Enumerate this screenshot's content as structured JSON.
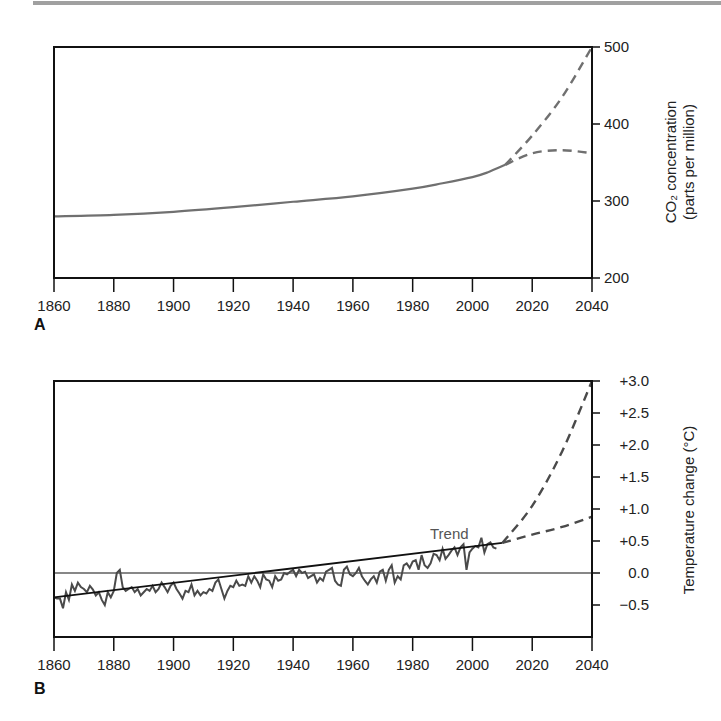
{
  "chart_data": [
    {
      "panel": "A",
      "type": "line",
      "title": "",
      "xlabel": "",
      "ylabel": "CO2 concentration (parts per million)",
      "ylabel_line1": "CO₂ concentration",
      "ylabel_line2": "(parts per million)",
      "xlim": [
        1860,
        2040
      ],
      "ylim": [
        200,
        500
      ],
      "x_ticks": [
        1860,
        1880,
        1900,
        1920,
        1940,
        1960,
        1980,
        2000,
        2020,
        2040
      ],
      "y_ticks": [
        200,
        300,
        400,
        500
      ],
      "y_axis_position": "right",
      "grid": false,
      "series": [
        {
          "name": "Observed CO2",
          "style": "solid",
          "color": "#707070",
          "x": [
            1860,
            1880,
            1900,
            1920,
            1940,
            1960,
            1980,
            1990,
            2000,
            2005,
            2011
          ],
          "values": [
            280,
            282,
            286,
            292,
            299,
            306,
            316,
            323,
            331,
            337,
            347
          ]
        },
        {
          "name": "Projection (high)",
          "style": "dashed",
          "color": "#707070",
          "x": [
            2011,
            2020,
            2030,
            2040
          ],
          "values": [
            347,
            385,
            435,
            500
          ]
        },
        {
          "name": "Projection (stabilized)",
          "style": "dashed",
          "color": "#707070",
          "x": [
            2011,
            2020,
            2030,
            2040
          ],
          "values": [
            347,
            362,
            366,
            362
          ]
        }
      ]
    },
    {
      "panel": "B",
      "type": "line",
      "title": "",
      "xlabel": "",
      "ylabel": "Temperature change (°C)",
      "xlim": [
        1860,
        2040
      ],
      "ylim": [
        -1.0,
        3.0
      ],
      "x_ticks": [
        1860,
        1880,
        1900,
        1920,
        1940,
        1960,
        1980,
        2000,
        2020,
        2040
      ],
      "y_ticks": [
        -0.5,
        0.0,
        0.5,
        1.0,
        1.5,
        2.0,
        2.5,
        3.0
      ],
      "y_tick_labels": [
        "−0.5",
        "0.0",
        "+0.5",
        "+1.0",
        "+1.5",
        "+2.0",
        "+2.5",
        "+3.0"
      ],
      "y_axis_position": "right",
      "reference_line": 0.0,
      "grid": false,
      "annotations": [
        {
          "text": "Trend",
          "x": 1990,
          "y": 0.62
        }
      ],
      "series": [
        {
          "name": "Annual temperature anomaly",
          "style": "solid",
          "color": "#4a4a4a",
          "x": [
            1860,
            1861,
            1862,
            1863,
            1864,
            1865,
            1866,
            1867,
            1868,
            1869,
            1870,
            1871,
            1872,
            1873,
            1874,
            1875,
            1876,
            1877,
            1878,
            1879,
            1880,
            1881,
            1882,
            1883,
            1884,
            1885,
            1886,
            1887,
            1888,
            1889,
            1890,
            1891,
            1892,
            1893,
            1894,
            1895,
            1896,
            1897,
            1898,
            1899,
            1900,
            1901,
            1902,
            1903,
            1904,
            1905,
            1906,
            1907,
            1908,
            1909,
            1910,
            1911,
            1912,
            1913,
            1914,
            1915,
            1916,
            1917,
            1918,
            1919,
            1920,
            1921,
            1922,
            1923,
            1924,
            1925,
            1926,
            1927,
            1928,
            1929,
            1930,
            1931,
            1932,
            1933,
            1934,
            1935,
            1936,
            1937,
            1938,
            1939,
            1940,
            1941,
            1942,
            1943,
            1944,
            1945,
            1946,
            1947,
            1948,
            1949,
            1950,
            1951,
            1952,
            1953,
            1954,
            1955,
            1956,
            1957,
            1958,
            1959,
            1960,
            1961,
            1962,
            1963,
            1964,
            1965,
            1966,
            1967,
            1968,
            1969,
            1970,
            1971,
            1972,
            1973,
            1974,
            1975,
            1976,
            1977,
            1978,
            1979,
            1980,
            1981,
            1982,
            1983,
            1984,
            1985,
            1986,
            1987,
            1988,
            1989,
            1990,
            1991,
            1992,
            1993,
            1994,
            1995,
            1996,
            1997,
            1998,
            1999,
            2000,
            2001,
            2002,
            2003,
            2004,
            2005,
            2006,
            2007,
            2008
          ],
          "values": [
            -0.38,
            -0.4,
            -0.4,
            -0.55,
            -0.3,
            -0.42,
            -0.18,
            -0.28,
            -0.15,
            -0.22,
            -0.25,
            -0.3,
            -0.2,
            -0.26,
            -0.35,
            -0.3,
            -0.42,
            -0.5,
            -0.3,
            -0.38,
            -0.28,
            0.0,
            0.05,
            -0.22,
            -0.28,
            -0.25,
            -0.22,
            -0.3,
            -0.25,
            -0.35,
            -0.3,
            -0.25,
            -0.28,
            -0.2,
            -0.3,
            -0.25,
            -0.15,
            -0.22,
            -0.3,
            -0.2,
            -0.15,
            -0.25,
            -0.32,
            -0.4,
            -0.28,
            -0.3,
            -0.18,
            -0.35,
            -0.28,
            -0.35,
            -0.3,
            -0.32,
            -0.25,
            -0.28,
            -0.15,
            -0.1,
            -0.25,
            -0.4,
            -0.28,
            -0.2,
            -0.22,
            -0.12,
            -0.2,
            -0.18,
            -0.2,
            -0.05,
            -0.15,
            -0.05,
            -0.12,
            -0.22,
            -0.02,
            -0.1,
            -0.12,
            -0.22,
            -0.05,
            -0.12,
            -0.1,
            0.0,
            -0.02,
            0.02,
            0.05,
            -0.05,
            0.05,
            0.0,
            0.02,
            -0.08,
            -0.05,
            -0.02,
            -0.15,
            -0.08,
            -0.12,
            0.02,
            0.05,
            0.08,
            -0.12,
            -0.18,
            -0.2,
            0.05,
            0.1,
            -0.02,
            -0.05,
            0.0,
            0.08,
            -0.05,
            -0.12,
            -0.18,
            -0.1,
            -0.05,
            -0.15,
            0.02,
            0.05,
            -0.12,
            0.05,
            0.12,
            -0.15,
            -0.05,
            -0.1,
            0.12,
            0.15,
            0.08,
            0.18,
            0.2,
            0.05,
            0.28,
            0.12,
            0.08,
            0.15,
            0.3,
            0.28,
            0.2,
            0.38,
            0.22,
            0.28,
            0.35,
            0.4,
            0.28,
            0.4,
            0.45,
            0.05,
            0.32,
            0.38,
            0.42,
            0.4,
            0.55,
            0.32,
            0.45,
            0.48,
            0.4,
            0.38,
            0.45,
            0.42,
            0.48,
            0.42
          ]
        },
        {
          "name": "Trend",
          "style": "solid",
          "color": "#111111",
          "x": [
            1860,
            2010
          ],
          "values": [
            -0.38,
            0.47
          ]
        },
        {
          "name": "Projection (high)",
          "style": "dashed",
          "color": "#4a4a4a",
          "x": [
            2010,
            2020,
            2030,
            2040
          ],
          "values": [
            0.47,
            1.05,
            1.9,
            3.0
          ]
        },
        {
          "name": "Projection (low)",
          "style": "dashed",
          "color": "#4a4a4a",
          "x": [
            2010,
            2020,
            2030,
            2040
          ],
          "values": [
            0.47,
            0.6,
            0.72,
            0.88
          ]
        }
      ]
    }
  ],
  "panels": {
    "a_label": "A",
    "b_label": "B"
  },
  "colors": {
    "axis": "#111111",
    "co2_line": "#707070",
    "temp_line": "#4a4a4a",
    "trend_line": "#111111",
    "top_rule": "#a0a0a0"
  }
}
